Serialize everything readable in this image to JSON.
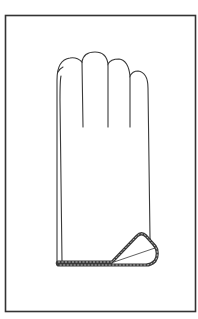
{
  "figure": {
    "frame": {
      "x": 5,
      "y": 15,
      "width": 191,
      "height": 297,
      "stroke": "#333333"
    },
    "colors": {
      "line": "#3a3a3a",
      "background": "#ffffff",
      "band_fill": "#8a8a8a"
    }
  },
  "caption": {
    "text": ""
  }
}
